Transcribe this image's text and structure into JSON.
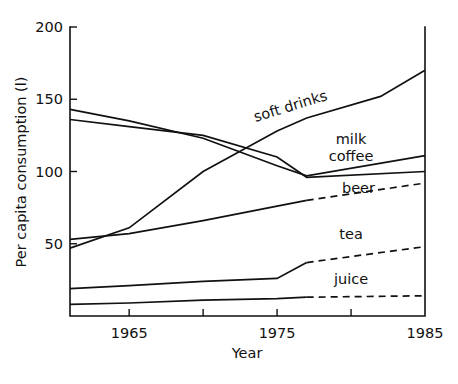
{
  "chart_data": {
    "type": "line",
    "title": "",
    "xlabel": "Year",
    "ylabel": "Per capita consumption (l)",
    "xlim": [
      1961,
      1985
    ],
    "ylim": [
      0,
      200
    ],
    "xticks": [
      1965,
      1970,
      1975,
      1980,
      1985
    ],
    "xtick_labels": [
      "1965",
      "",
      "1975",
      "",
      "1985"
    ],
    "yticks": [
      0,
      50,
      100,
      150,
      200
    ],
    "ytick_labels": [
      "",
      "50",
      "100",
      "150",
      "200"
    ],
    "grid": false,
    "legend_position": "inline-labels",
    "forecast_start_year": 1977,
    "series": [
      {
        "name": "soft drinks",
        "label": "soft drinks",
        "style": "solid",
        "x": [
          1961,
          1965,
          1970,
          1975,
          1977,
          1982,
          1985
        ],
        "values": [
          47,
          61,
          100,
          128,
          137,
          152,
          170
        ]
      },
      {
        "name": "milk",
        "label": "milk",
        "style": "solid",
        "x": [
          1961,
          1965,
          1970,
          1975,
          1977,
          1985
        ],
        "values": [
          143,
          135,
          123,
          104,
          97,
          111
        ]
      },
      {
        "name": "coffee",
        "label": "coffee",
        "style": "solid",
        "x": [
          1961,
          1965,
          1970,
          1975,
          1977,
          1985
        ],
        "values": [
          136,
          131,
          125,
          110,
          96,
          100
        ]
      },
      {
        "name": "beer",
        "label": "beer",
        "style": "solid-then-dashed",
        "x": [
          1961,
          1965,
          1970,
          1975,
          1977,
          1985
        ],
        "values": [
          53,
          57,
          66,
          76,
          80,
          92
        ]
      },
      {
        "name": "tea",
        "label": "tea",
        "style": "solid-then-dashed",
        "x": [
          1961,
          1965,
          1970,
          1975,
          1977,
          1985
        ],
        "values": [
          19,
          21,
          24,
          26,
          37,
          48
        ]
      },
      {
        "name": "juice",
        "label": "juice",
        "style": "solid-then-dashed",
        "x": [
          1961,
          1965,
          1970,
          1975,
          1977,
          1985
        ],
        "values": [
          8,
          9,
          11,
          12,
          13,
          14
        ]
      }
    ],
    "annotations": [
      {
        "text": "soft drinks",
        "x": 1976,
        "y": 142,
        "rotation": -17
      },
      {
        "text": "milk",
        "x": 1980,
        "y": 119,
        "rotation": 0
      },
      {
        "text": "coffee",
        "x": 1980,
        "y": 107,
        "rotation": 0
      },
      {
        "text": "beer",
        "x": 1980.5,
        "y": 85,
        "rotation": 0
      },
      {
        "text": "tea",
        "x": 1980,
        "y": 53,
        "rotation": 0
      },
      {
        "text": "juice",
        "x": 1980,
        "y": 22,
        "rotation": 0
      }
    ],
    "colors": {
      "line": "#111111",
      "axis": "#111111",
      "background": "#ffffff"
    }
  }
}
